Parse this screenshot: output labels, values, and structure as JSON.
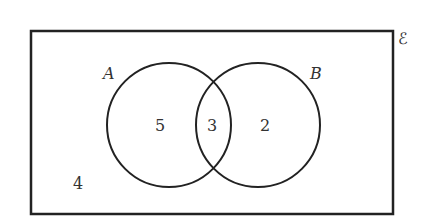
{
  "venn": {
    "universal_symbol": "ℰ",
    "set_a_label": "A",
    "set_b_label": "B",
    "only_a": "5",
    "a_and_b": "3",
    "only_b": "2",
    "outside": "4"
  }
}
